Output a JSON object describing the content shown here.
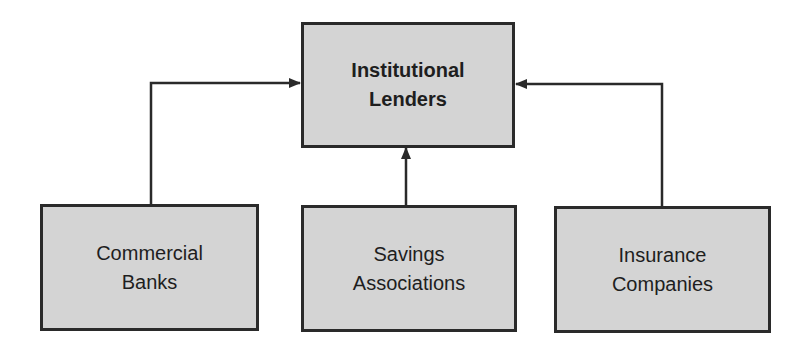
{
  "diagram": {
    "type": "hierarchy",
    "colors": {
      "box_fill": "#d4d4d4",
      "box_border": "#2a2a2a",
      "line": "#2a2a2a",
      "text": "#1e1e1e",
      "background": "#ffffff"
    },
    "top_node": {
      "label": "Institutional\nLenders"
    },
    "child_nodes": [
      {
        "label": "Commercial\nBanks"
      },
      {
        "label": "Savings\nAssociations"
      },
      {
        "label": "Insurance\nCompanies"
      }
    ],
    "edges": [
      {
        "from": "Commercial Banks",
        "to": "Institutional Lenders"
      },
      {
        "from": "Savings Associations",
        "to": "Institutional Lenders"
      },
      {
        "from": "Insurance Companies",
        "to": "Institutional Lenders"
      }
    ]
  }
}
